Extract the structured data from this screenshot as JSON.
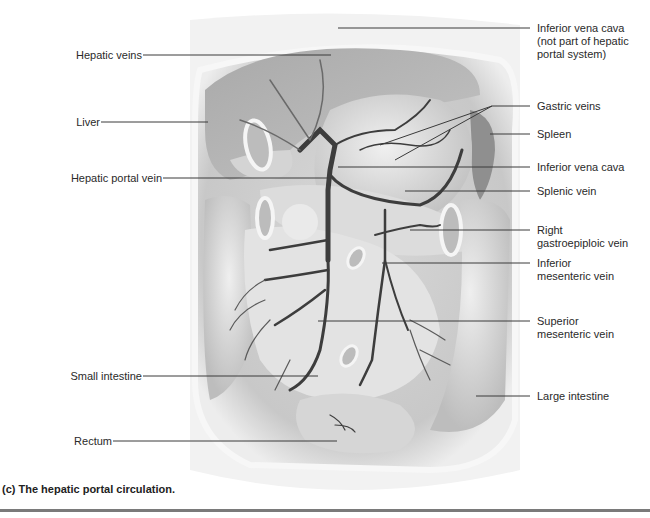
{
  "figure": {
    "caption": "(c) The hepatic portal circulation.",
    "labels_left": [
      {
        "id": "hepatic-veins",
        "text": "Hepatic veins"
      },
      {
        "id": "liver",
        "text": "Liver"
      },
      {
        "id": "hepatic-portal-vein",
        "text": "Hepatic portal vein"
      },
      {
        "id": "small-intestine",
        "text": "Small intestine"
      },
      {
        "id": "rectum",
        "text": "Rectum"
      }
    ],
    "labels_right": [
      {
        "id": "inferior-vena-cava-top",
        "lines": [
          "Inferior vena cava",
          "(not part of hepatic",
          "portal system)"
        ]
      },
      {
        "id": "gastric-veins",
        "lines": [
          "Gastric veins"
        ]
      },
      {
        "id": "spleen",
        "lines": [
          "Spleen"
        ]
      },
      {
        "id": "inferior-vena-cava",
        "lines": [
          "Inferior vena cava"
        ]
      },
      {
        "id": "splenic-vein",
        "lines": [
          "Splenic vein"
        ]
      },
      {
        "id": "right-gastroepiploic-vein",
        "lines": [
          "Right",
          "gastroepiploic vein"
        ]
      },
      {
        "id": "inferior-mesenteric-vein",
        "lines": [
          "Inferior",
          "mesenteric vein"
        ]
      },
      {
        "id": "superior-mesenteric-vein",
        "lines": [
          "Superior",
          "mesenteric vein"
        ]
      },
      {
        "id": "large-intestine",
        "lines": [
          "Large intestine"
        ]
      }
    ]
  },
  "colors": {
    "leader": "#3a3a3a",
    "vein": "#3d3d3d",
    "tissue_light": "#e6e6e6",
    "tissue_mid": "#c9c9c9",
    "tissue_dark": "#9a9a9a",
    "rule": "#7a7a7a"
  }
}
